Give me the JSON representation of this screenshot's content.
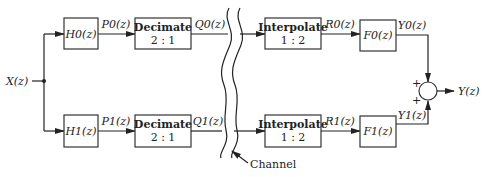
{
  "diagram": {
    "input_label": "X(z)",
    "output_label": "Y(z)",
    "channel_label": "Channel",
    "branches": [
      {
        "analysis_filter": "H0(z)",
        "p_signal": "P0(z)",
        "decimate_label": "Decimate",
        "decimate_ratio": "2 : 1",
        "q_signal": "Q0(z)",
        "interpolate_label": "Interpolate",
        "interpolate_ratio": "1 : 2",
        "r_signal": "R0(z)",
        "synthesis_filter": "F0(z)",
        "y_signal": "Y0(z)",
        "sum_sign": "+"
      },
      {
        "analysis_filter": "H1(z)",
        "p_signal": "P1(z)",
        "decimate_label": "Decimate",
        "decimate_ratio": "2 : 1",
        "q_signal": "Q1(z)",
        "interpolate_label": "Interpolate",
        "interpolate_ratio": "1 : 2",
        "r_signal": "R1(z)",
        "synthesis_filter": "F1(z)",
        "y_signal": "Y1(z)",
        "sum_sign": "+"
      }
    ]
  }
}
